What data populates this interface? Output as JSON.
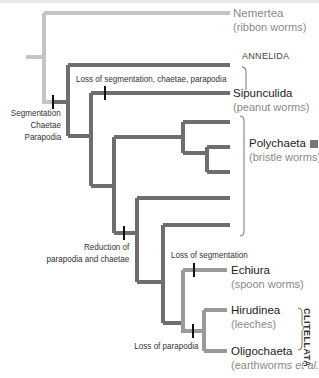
{
  "diagram": {
    "type": "phylogenetic-tree",
    "colors": {
      "outgroup_branch": "#c4c4c4",
      "annelid_branch": "#6e6e6e",
      "clitellate_branch": "#9a9a9a",
      "tick_mark": "#111111",
      "polychaeta_marker": "#777777"
    },
    "group_label": "ANNELIDA",
    "clade_label": "CLITELLATA",
    "taxa": [
      {
        "name": "Nemertea",
        "common": "(ribbon worms)"
      },
      {
        "name": "Sipunculida",
        "common": "(peanut worms)"
      },
      {
        "name": "Polychaeta",
        "common": "(bristle worms)"
      },
      {
        "name": "Echiura",
        "common": "(spoon worms)"
      },
      {
        "name": "Hirudinea",
        "common": "(leeches)"
      },
      {
        "name": "Oligochaeta",
        "common_prefix": "(earthworms ",
        "common_italic": "et al.",
        "common_suffix": ")"
      }
    ],
    "events": {
      "segmentation": [
        "Segmentation",
        "Chaetae",
        "Parapodia"
      ],
      "loss_top": "Loss of segmentation, chaetae, parapodia",
      "reduction": [
        "Reduction of",
        "parapodia and chaetae"
      ],
      "loss_segmentation": "Loss of segmentation",
      "loss_parapodia": "Loss of parapodia"
    }
  }
}
